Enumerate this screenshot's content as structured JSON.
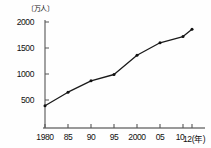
{
  "chart_data": {
    "type": "line",
    "title": "",
    "unit_label": "〔万人〕",
    "xlabel": "(年)",
    "ylabel": "",
    "x": [
      1980,
      1985,
      1990,
      1995,
      2000,
      2005,
      2010,
      2012
    ],
    "xtick_labels": [
      "1980",
      "85",
      "90",
      "95",
      "2000",
      "05",
      "10",
      "12(年)"
    ],
    "values": [
      390,
      650,
      870,
      990,
      1360,
      1600,
      1720,
      1860
    ],
    "ytick_labels": [
      "2000",
      "1500",
      "1000",
      "500"
    ],
    "yticks": [
      2000,
      1500,
      1000,
      500
    ],
    "ylim": [
      0,
      2100
    ],
    "xlim": [
      1980,
      2012
    ],
    "grid": false,
    "legend": "none",
    "series_name": "",
    "marker": "dot",
    "line_color": "#1a1a1a",
    "axis_color": "#555555"
  },
  "axis": {
    "y_axis_name": "y-axis",
    "x_axis_name": "x-axis"
  }
}
